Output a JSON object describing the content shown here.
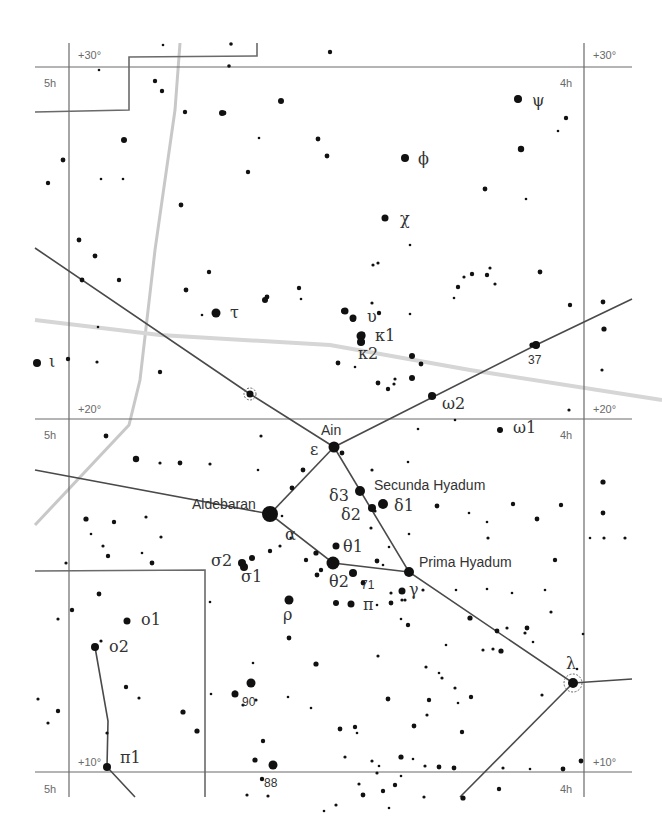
{
  "chart": {
    "colors": {
      "background": "#ffffff",
      "grid": "#6a6a6a",
      "stars": "#111111",
      "milky_way": "#c8c8c8",
      "ecliptic": "#d6d6d6",
      "stick": "#4a4a4a"
    }
  },
  "grid_labels": {
    "dec_30_left": "+30°",
    "dec_30_right": "+30°",
    "dec_20_left": "+20°",
    "dec_20_right": "+20°",
    "dec_10_left": "+10°",
    "dec_10_right": "+10°",
    "ra5h_top": "5h",
    "ra5h_mid": "5h",
    "ra5h_bottom": "5h",
    "ra4h_top": "4h",
    "ra4h_mid": "4h",
    "ra4h_bottom": "4h"
  },
  "named_stars": {
    "aldebaran": "Aldebaran",
    "ain": "Ain",
    "secunda": "Secunda Hyadum",
    "prima": "Prima Hyadum"
  },
  "greek_labels": {
    "psi": "ψ",
    "phi": "ϕ",
    "chi": "χ",
    "tau": "τ",
    "upsilon": "υ",
    "kappa1": "κ1",
    "kappa2": "κ2",
    "iota": "ι",
    "omega2": "ω2",
    "omega1": "ω1",
    "epsilon": "ε",
    "delta3": "δ3",
    "delta2": "δ2",
    "delta1": "δ1",
    "alpha": "α",
    "theta1": "θ1",
    "theta2": "θ2",
    "sigma2": "σ2",
    "sigma1": "σ1",
    "gamma": "γ",
    "pi": "π",
    "rho": "ρ",
    "omicron1": "o1",
    "omicron2": "o2",
    "lambda": "λ",
    "pi1": "π1"
  },
  "number_labels": {
    "n37": "37",
    "n71": "71",
    "n90": "90",
    "n88": "88"
  },
  "stars": [
    [
      99,
      70,
      1.3
    ],
    [
      229,
      66,
      1.8
    ],
    [
      231,
      44,
      1.8
    ],
    [
      163,
      45,
      1.3
    ],
    [
      155,
      81,
      2.2
    ],
    [
      162,
      91,
      2.2
    ],
    [
      185,
      112,
      2.2
    ],
    [
      222,
      113,
      3
    ],
    [
      281,
      101,
      3
    ],
    [
      259,
      138,
      1.3
    ],
    [
      318,
      139,
      2.4
    ],
    [
      327,
      156,
      2.4
    ],
    [
      248,
      172,
      2.2
    ],
    [
      224,
      113,
      2.4
    ],
    [
      124,
      140,
      3
    ],
    [
      101,
      179,
      1.3
    ],
    [
      63,
      160,
      2.4
    ],
    [
      48,
      183,
      2.2
    ],
    [
      123,
      179,
      1.3
    ],
    [
      181,
      205,
      2.4
    ],
    [
      330,
      52,
      2.2
    ],
    [
      518,
      99,
      3.4
    ],
    [
      521,
      149,
      3.2
    ],
    [
      566,
      118,
      2.2
    ],
    [
      558,
      131,
      1.3
    ],
    [
      485,
      189,
      2.4
    ],
    [
      526,
      199,
      1.3
    ],
    [
      405,
      158,
      3.2
    ],
    [
      385,
      218,
      2.8
    ],
    [
      373,
      265,
      1.6
    ],
    [
      378,
      263,
      1.6
    ],
    [
      410,
      245,
      1.3
    ],
    [
      209,
      272,
      2.2
    ],
    [
      267,
      297,
      2.4
    ],
    [
      186,
      290,
      2.4
    ],
    [
      79,
      240,
      2.4
    ],
    [
      95,
      256,
      2.4
    ],
    [
      82,
      280,
      2.4
    ],
    [
      119,
      280,
      2.2
    ],
    [
      98,
      327,
      1.3
    ],
    [
      68,
      359,
      2.2
    ],
    [
      160,
      372,
      2.2
    ],
    [
      97,
      362,
      1.6
    ],
    [
      216,
      313,
      3.4
    ],
    [
      202,
      315,
      1.3
    ],
    [
      265,
      300,
      3
    ],
    [
      299,
      288,
      2.2
    ],
    [
      301,
      299,
      1.3
    ],
    [
      372,
      303,
      1.6
    ],
    [
      379,
      313,
      2.2
    ],
    [
      344,
      311,
      3
    ],
    [
      353,
      319,
      3
    ],
    [
      362,
      335,
      3.4
    ],
    [
      362,
      342,
      2.8
    ],
    [
      338,
      363,
      2.4
    ],
    [
      355,
      367,
      1.3
    ],
    [
      412,
      356,
      3
    ],
    [
      421,
      364,
      2.4
    ],
    [
      412,
      378,
      3
    ],
    [
      378,
      383,
      2.4
    ],
    [
      394,
      384,
      1.6
    ],
    [
      395,
      379,
      1.6
    ],
    [
      388,
      389,
      2.2
    ],
    [
      410,
      314,
      1.3
    ],
    [
      454,
      298,
      1.3
    ],
    [
      458,
      287,
      2.2
    ],
    [
      472,
      274,
      2.2
    ],
    [
      464,
      277,
      1.6
    ],
    [
      490,
      268,
      1.6
    ],
    [
      487,
      275,
      2.2
    ],
    [
      495,
      284,
      1.6
    ],
    [
      540,
      272,
      2.4
    ],
    [
      570,
      305,
      2.2
    ],
    [
      603,
      302,
      2.4
    ],
    [
      604,
      329,
      2.6
    ],
    [
      602,
      370,
      1.6
    ],
    [
      569,
      410,
      1.6
    ],
    [
      433,
      396,
      3
    ],
    [
      536,
      345,
      3.4
    ],
    [
      532,
      345,
      2.6
    ],
    [
      455,
      420,
      1.3
    ],
    [
      500,
      430,
      2.4
    ],
    [
      603,
      482,
      2.6
    ],
    [
      603,
      513,
      2.4
    ],
    [
      590,
      538,
      1.3
    ],
    [
      625,
      538,
      1.6
    ],
    [
      545,
      590,
      1.3
    ],
    [
      551,
      612,
      1.6
    ],
    [
      512,
      593,
      1.3
    ],
    [
      418,
      429,
      1.3
    ],
    [
      372,
      470,
      1.6
    ],
    [
      408,
      462,
      1.3
    ],
    [
      342,
      453,
      2.4
    ],
    [
      303,
      470,
      2.4
    ],
    [
      258,
      470,
      1.3
    ],
    [
      261,
      436,
      1.6
    ],
    [
      136,
      459,
      3.2
    ],
    [
      160,
      463,
      1.6
    ],
    [
      180,
      463,
      2.4
    ],
    [
      210,
      464,
      1.6
    ],
    [
      106,
      436,
      2.4
    ],
    [
      86,
      519,
      2.6
    ],
    [
      114,
      522,
      2.2
    ],
    [
      146,
      517,
      1.6
    ],
    [
      161,
      537,
      1.6
    ],
    [
      91,
      534,
      1.3
    ],
    [
      103,
      546,
      1.6
    ],
    [
      108,
      556,
      2.2
    ],
    [
      142,
      553,
      1.3
    ],
    [
      152,
      563,
      2.4
    ],
    [
      66,
      563,
      1.6
    ],
    [
      292,
      488,
      2.4
    ],
    [
      282,
      516,
      1.3
    ],
    [
      270,
      551,
      2.2
    ],
    [
      280,
      546,
      1.6
    ],
    [
      291,
      538,
      1.6
    ],
    [
      306,
      560,
      2.2
    ],
    [
      316,
      553,
      2.6
    ],
    [
      317,
      575,
      2.4
    ],
    [
      321,
      570,
      2.2
    ],
    [
      363,
      583,
      2.4
    ],
    [
      383,
      565,
      1.3
    ],
    [
      375,
      511,
      1.6
    ],
    [
      371,
      528,
      1.6
    ],
    [
      389,
      547,
      1.3
    ],
    [
      377,
      561,
      2.4
    ],
    [
      409,
      534,
      1.3
    ],
    [
      437,
      506,
      2.4
    ],
    [
      469,
      513,
      1.3
    ],
    [
      487,
      522,
      1.3
    ],
    [
      513,
      504,
      2.2
    ],
    [
      488,
      538,
      1.6
    ],
    [
      537,
      519,
      2.4
    ],
    [
      561,
      505,
      2.2
    ],
    [
      555,
      560,
      2.2
    ],
    [
      604,
      538,
      1.6
    ],
    [
      456,
      590,
      1.3
    ],
    [
      423,
      590,
      1.6
    ],
    [
      391,
      593,
      1.6
    ],
    [
      402,
      600,
      1.6
    ],
    [
      391,
      603,
      2.4
    ],
    [
      405,
      600,
      1.6
    ],
    [
      401,
      619,
      1.3
    ],
    [
      99,
      594,
      2.4
    ],
    [
      72,
      610,
      2.2
    ],
    [
      58,
      619,
      1.6
    ],
    [
      101,
      641,
      1.6
    ],
    [
      126,
      687,
      2.2
    ],
    [
      139,
      698,
      1.6
    ],
    [
      107,
      733,
      1.6
    ],
    [
      58,
      711,
      2.2
    ],
    [
      48,
      723,
      1.6
    ],
    [
      38,
      699,
      1.6
    ],
    [
      183,
      712,
      2.6
    ],
    [
      197,
      731,
      2.6
    ],
    [
      210,
      602,
      1.3
    ],
    [
      211,
      694,
      1.3
    ],
    [
      256,
      700,
      1.6
    ],
    [
      253,
      663,
      1.3
    ],
    [
      235,
      693,
      2.6
    ],
    [
      243,
      705,
      1.6
    ],
    [
      289,
      638,
      2.4
    ],
    [
      288,
      697,
      1.3
    ],
    [
      316,
      664,
      2.6
    ],
    [
      311,
      708,
      1.3
    ],
    [
      263,
      741,
      2.2
    ],
    [
      340,
      729,
      2.4
    ],
    [
      355,
      727,
      2.2
    ],
    [
      345,
      757,
      1.6
    ],
    [
      379,
      766,
      1.3
    ],
    [
      383,
      791,
      2.2
    ],
    [
      377,
      773,
      1.6
    ],
    [
      372,
      761,
      1.6
    ],
    [
      413,
      759,
      1.3
    ],
    [
      425,
      766,
      1.6
    ],
    [
      388,
      699,
      2.4
    ],
    [
      357,
      733,
      1.3
    ],
    [
      439,
      673,
      1.3
    ],
    [
      408,
      625,
      2.2
    ],
    [
      446,
      645,
      1.3
    ],
    [
      426,
      667,
      1.6
    ],
    [
      378,
      656,
      1.6
    ],
    [
      458,
      703,
      1.3
    ],
    [
      414,
      726,
      2.4
    ],
    [
      470,
      618,
      2.6
    ],
    [
      497,
      631,
      2.4
    ],
    [
      525,
      633,
      1.6
    ],
    [
      507,
      628,
      1.6
    ],
    [
      527,
      628,
      2.4
    ],
    [
      533,
      642,
      1.3
    ],
    [
      583,
      634,
      1.3
    ],
    [
      542,
      695,
      1.6
    ],
    [
      493,
      649,
      1.6
    ],
    [
      487,
      589,
      1.3
    ],
    [
      401,
      776,
      1.3
    ],
    [
      377,
      605,
      1.3
    ],
    [
      454,
      768,
      2.4
    ],
    [
      463,
      798,
      2.6
    ],
    [
      499,
      789,
      2.2
    ],
    [
      401,
      757,
      2.6
    ],
    [
      439,
      767,
      2.4
    ],
    [
      503,
      768,
      1.6
    ],
    [
      530,
      769,
      1.3
    ],
    [
      563,
      769,
      2.4
    ],
    [
      581,
      761,
      2.4
    ],
    [
      577,
      669,
      1.3
    ],
    [
      483,
      650,
      1.6
    ],
    [
      501,
      651,
      2.6
    ],
    [
      442,
      678,
      1.6
    ],
    [
      455,
      688,
      1.6
    ],
    [
      471,
      697,
      2.2
    ],
    [
      429,
      700,
      2.2
    ],
    [
      427,
      715,
      1.6
    ],
    [
      462,
      732,
      2.2
    ],
    [
      389,
      808,
      1.3
    ],
    [
      424,
      797,
      1.6
    ],
    [
      395,
      785,
      2.2
    ],
    [
      255,
      760,
      2.6
    ],
    [
      247,
      795,
      1.6
    ],
    [
      324,
      811,
      1.3
    ],
    [
      336,
      805,
      1.6
    ],
    [
      359,
      784,
      1.6
    ],
    [
      363,
      795,
      2.4
    ],
    [
      262,
      779,
      2.2
    ],
    [
      268,
      796,
      1.6
    ]
  ],
  "bright_stars": [
    {
      "name": "aldebaran",
      "x": 270,
      "y": 514,
      "r": 8
    },
    {
      "name": "ain",
      "x": 334,
      "y": 447,
      "r": 5.5
    },
    {
      "name": "secunda",
      "x": 360,
      "y": 491,
      "r": 5
    },
    {
      "name": "delta1",
      "x": 383,
      "y": 504,
      "r": 5
    },
    {
      "name": "delta2",
      "x": 372,
      "y": 508,
      "r": 4
    },
    {
      "name": "prima",
      "x": 409,
      "y": 572,
      "r": 5
    },
    {
      "name": "theta2",
      "x": 333,
      "y": 563,
      "r": 6.5
    },
    {
      "name": "theta1",
      "x": 336,
      "y": 546,
      "r": 3.5
    },
    {
      "name": "n71",
      "x": 353,
      "y": 573,
      "r": 4
    },
    {
      "name": "gamma_sub",
      "x": 402,
      "y": 591,
      "r": 3.5
    },
    {
      "name": "pi",
      "x": 351,
      "y": 604,
      "r": 3.5
    },
    {
      "name": "pi_b",
      "x": 336,
      "y": 603,
      "r": 3
    },
    {
      "name": "rho",
      "x": 289,
      "y": 600,
      "r": 4.5
    },
    {
      "name": "sigma2",
      "x": 242,
      "y": 563,
      "r": 4
    },
    {
      "name": "sigma1",
      "x": 244,
      "y": 567,
      "r": 4
    },
    {
      "name": "sigma_b",
      "x": 252,
      "y": 558,
      "r": 3
    },
    {
      "name": "lambda",
      "x": 573,
      "y": 683,
      "r": 5
    },
    {
      "name": "n37",
      "x": 536,
      "y": 345,
      "r": 4
    },
    {
      "name": "omega2",
      "x": 432,
      "y": 396,
      "r": 4
    },
    {
      "name": "omega1",
      "x": 500,
      "y": 430,
      "r": 3
    },
    {
      "name": "tau",
      "x": 216,
      "y": 313,
      "r": 4.5
    },
    {
      "name": "iota",
      "x": 37,
      "y": 363,
      "r": 4
    },
    {
      "name": "kappa1",
      "x": 361,
      "y": 336,
      "r": 4.5
    },
    {
      "name": "kappa2",
      "x": 361,
      "y": 342,
      "r": 4
    },
    {
      "name": "upsilon",
      "x": 345,
      "y": 311,
      "r": 3.5
    },
    {
      "name": "upsilon_b",
      "x": 353,
      "y": 318,
      "r": 3.5
    },
    {
      "name": "phi",
      "x": 405,
      "y": 158,
      "r": 4
    },
    {
      "name": "chi",
      "x": 385,
      "y": 218,
      "r": 3.5
    },
    {
      "name": "psi",
      "x": 518,
      "y": 99,
      "r": 4
    },
    {
      "name": "omicron1",
      "x": 127,
      "y": 621,
      "r": 3.5
    },
    {
      "name": "omicron2",
      "x": 95,
      "y": 647,
      "r": 4
    },
    {
      "name": "pi1",
      "x": 107,
      "y": 767,
      "r": 4
    },
    {
      "name": "n90",
      "x": 251,
      "y": 683,
      "r": 4.5
    },
    {
      "name": "n90b",
      "x": 235,
      "y": 694,
      "r": 3.5
    },
    {
      "name": "n88",
      "x": 273,
      "y": 765,
      "r": 4.5
    },
    {
      "name": "var_circle_star",
      "x": 250,
      "y": 394,
      "r": 3.5
    }
  ]
}
